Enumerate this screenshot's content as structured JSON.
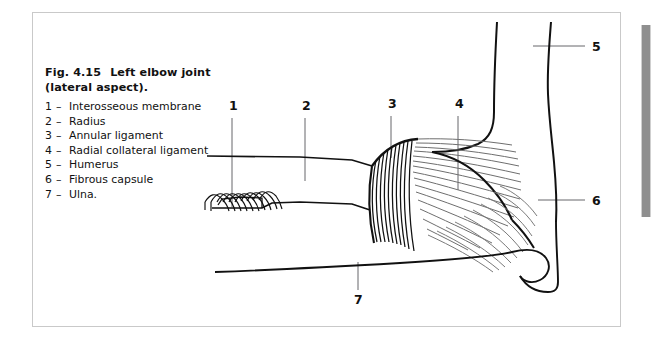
{
  "figure": {
    "caption_number": "Fig. 4.15",
    "caption_title": "Left elbow joint (lateral aspect).",
    "legend": [
      {
        "number": "1",
        "dash": "–",
        "label": "Interosseous membrane"
      },
      {
        "number": "2",
        "dash": "–",
        "label": "Radius"
      },
      {
        "number": "3",
        "dash": "–",
        "label": "Annular ligament"
      },
      {
        "number": "4",
        "dash": "–",
        "label": "Radial collateral ligament"
      },
      {
        "number": "5",
        "dash": "–",
        "label": "Humerus"
      },
      {
        "number": "6",
        "dash": "–",
        "label": "Fibrous capsule"
      },
      {
        "number": "7",
        "dash": "–",
        "label": "Ulna."
      }
    ],
    "callouts": [
      {
        "id": "1",
        "text": "1",
        "refers_to": "Interosseous membrane",
        "x": 229,
        "y": 105
      },
      {
        "id": "2",
        "text": "2",
        "refers_to": "Radius",
        "x": 302,
        "y": 105
      },
      {
        "id": "3",
        "text": "3",
        "refers_to": "Annular ligament",
        "x": 388,
        "y": 103
      },
      {
        "id": "4",
        "text": "4",
        "refers_to": "Radial collateral ligament",
        "x": 455,
        "y": 103
      },
      {
        "id": "5",
        "text": "5",
        "refers_to": "Humerus",
        "x": 592,
        "y": 41
      },
      {
        "id": "6",
        "text": "6",
        "refers_to": "Fibrous capsule",
        "x": 592,
        "y": 195
      },
      {
        "id": "7",
        "text": "7",
        "refers_to": "Ulna",
        "x": 354,
        "y": 298
      }
    ],
    "colors": {
      "ink": "#111111",
      "frame": "#c9c9c9",
      "leader_line": "#55555a",
      "fiber_light": "#8a8a8a",
      "page_edge_bar": "#8f8f8f",
      "background": "#ffffff"
    }
  }
}
